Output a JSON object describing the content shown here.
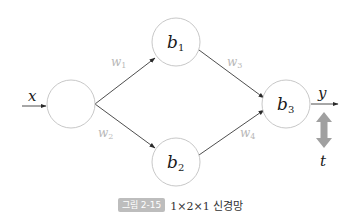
{
  "diagram": {
    "input_label": "x",
    "output_label": "y",
    "target_label": "t",
    "nodes": [
      {
        "id": "input",
        "label": "",
        "sub": "",
        "cx": 71,
        "cy": 104,
        "r": 24
      },
      {
        "id": "b1",
        "label": "b",
        "sub": "1",
        "cx": 176,
        "cy": 42,
        "r": 24
      },
      {
        "id": "b2",
        "label": "b",
        "sub": "2",
        "cx": 176,
        "cy": 162,
        "r": 24
      },
      {
        "id": "b3",
        "label": "b",
        "sub": "3",
        "cx": 286,
        "cy": 104,
        "r": 24
      }
    ],
    "weights": [
      {
        "label": "w",
        "sub": "1",
        "from": "input",
        "to": "b1"
      },
      {
        "label": "w",
        "sub": "2",
        "from": "input",
        "to": "b2"
      },
      {
        "label": "w",
        "sub": "3",
        "from": "b1",
        "to": "b3"
      },
      {
        "label": "w",
        "sub": "4",
        "from": "b2",
        "to": "b3"
      }
    ],
    "colors": {
      "node_stroke": "#c8c8c8",
      "edge": "#3a3a3a",
      "weight_label": "#b8b8b8",
      "target_arrow": "#a0a0a0",
      "caption_badge": "#bdbdbd"
    }
  },
  "caption": {
    "badge": "그림 2-15",
    "text": "1×2×1 신경망"
  }
}
